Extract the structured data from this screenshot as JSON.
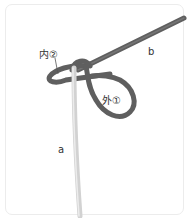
{
  "diagram": {
    "labels": {
      "inner": "内②",
      "outer": "外①",
      "cord_a": "a",
      "cord_b": "b"
    },
    "colors": {
      "cord_a": "#d4d4d4",
      "cord_b": "#6e6e6e",
      "leader_line": "#555555",
      "frame": "#ececec"
    }
  }
}
